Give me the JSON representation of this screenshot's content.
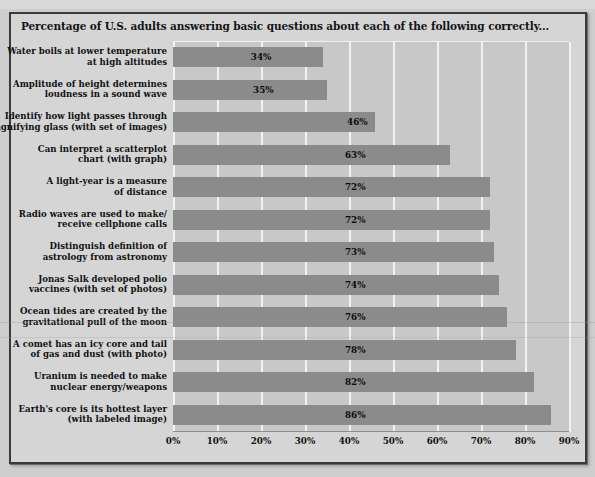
{
  "chart_title": "Percentage of U.S. adults answering basic questions about each of the following correctly...",
  "chart_data": {
    "type": "bar",
    "orientation": "horizontal",
    "title": "Percentage of U.S. adults answering basic questions about each of the following correctly...",
    "xlabel": "",
    "ylabel": "",
    "xlim": [
      0,
      90
    ],
    "grid": true,
    "legend": false,
    "xtick_labels": [
      "0%",
      "10%",
      "20%",
      "30%",
      "40%",
      "50%",
      "60%",
      "70%",
      "80%",
      "90%"
    ],
    "xtick_values": [
      0,
      10,
      20,
      30,
      40,
      50,
      60,
      70,
      80,
      90
    ],
    "categories": [
      "Water boils at lower temperature\nat high altitudes",
      "Amplitude of height determines\nloudness in a sound wave",
      "Identify how light passes through\nmagnifying glass (with set of images)",
      "Can interpret a scatterplot\nchart (with graph)",
      "A light-year is a measure\nof distance",
      "Radio waves are used to make/\nreceive cellphone calls",
      "Distinguish definition of\nastrology from astronomy",
      "Jonas Salk developed polio\nvaccines (with set of photos)",
      "Ocean tides are created by the\ngravitational pull of the moon",
      "A comet has an icy core and tail\nof gas and dust (with photo)",
      "Uranium is needed to make\nnuclear energy/weapons",
      "Earth's core is its hottest layer\n(with labeled image)"
    ],
    "values": [
      34,
      35,
      46,
      63,
      72,
      72,
      73,
      74,
      76,
      78,
      82,
      86
    ],
    "value_labels": [
      "34%",
      "35%",
      "46%",
      "63%",
      "72%",
      "72%",
      "73%",
      "74%",
      "76%",
      "78%",
      "82%",
      "86%"
    ],
    "colors": {
      "bar": "#8b8b8b",
      "plot_background": "#c8c8c8",
      "figure_background": "#d5d5d5",
      "gridline": "#f2f2f2",
      "text": "#111111",
      "frame": "#3b3b3b"
    }
  }
}
